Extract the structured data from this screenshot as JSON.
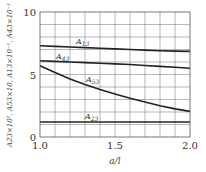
{
  "chart_data": {
    "type": "line",
    "title": "",
    "xlabel": "a/l",
    "ylabel": "A23×10², A53×10, A13×10⁻¹, A43×10⁻¹",
    "xlim": [
      1.0,
      2.0
    ],
    "ylim": [
      0,
      10
    ],
    "x_ticks": [
      "1.0",
      "1.5",
      "2.0"
    ],
    "y_ticks": [
      "0",
      "5",
      "10"
    ],
    "grid": true,
    "x": [
      1.0,
      1.1,
      1.2,
      1.3,
      1.4,
      1.5,
      1.6,
      1.7,
      1.8,
      1.9,
      2.0
    ],
    "series": [
      {
        "name": "A13",
        "values": [
          7.3,
          7.25,
          7.2,
          7.15,
          7.1,
          7.05,
          7.0,
          6.95,
          6.9,
          6.87,
          6.85
        ]
      },
      {
        "name": "A43",
        "values": [
          6.1,
          6.05,
          6.0,
          5.95,
          5.9,
          5.85,
          5.8,
          5.72,
          5.65,
          5.58,
          5.5
        ]
      },
      {
        "name": "A53",
        "values": [
          5.7,
          5.15,
          4.65,
          4.2,
          3.8,
          3.45,
          3.1,
          2.8,
          2.5,
          2.25,
          2.05
        ]
      },
      {
        "name": "A23",
        "values": [
          1.2,
          1.2,
          1.2,
          1.2,
          1.2,
          1.2,
          1.2,
          1.2,
          1.2,
          1.2,
          1.2
        ]
      }
    ],
    "legend_position": "inline labels on curves"
  },
  "labels": {
    "A13": {
      "base": "A",
      "sub": "13"
    },
    "A43": {
      "base": "A",
      "sub": "43"
    },
    "A53": {
      "base": "A",
      "sub": "53"
    },
    "A23": {
      "base": "A",
      "sub": "23"
    }
  }
}
